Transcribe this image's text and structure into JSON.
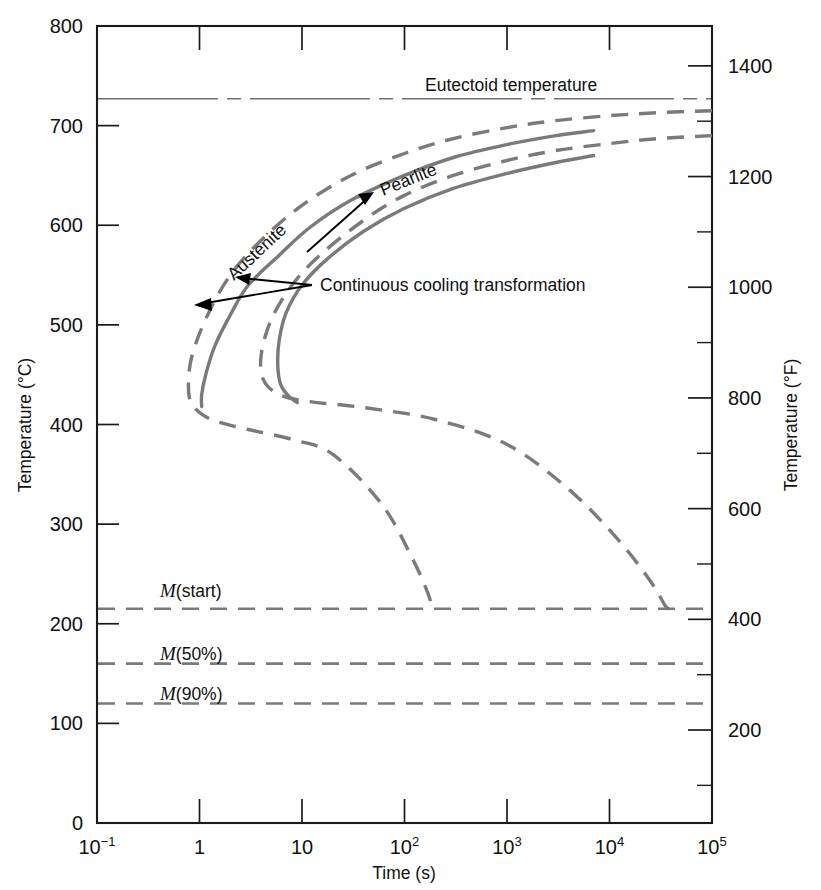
{
  "figure": {
    "kind": "continuous-cooling-transformation-diagram",
    "background_color": "#ffffff",
    "curve_color": "#7a7a7a",
    "axis_color": "#1a1a1a",
    "annotation_color": "#000000"
  },
  "axes": {
    "y_left": {
      "title": "Temperature (°C)",
      "ticks": [
        "800",
        "700",
        "600",
        "500",
        "400",
        "300",
        "200",
        "100",
        "0"
      ],
      "tick_values": [
        800,
        700,
        600,
        500,
        400,
        300,
        200,
        100,
        0
      ],
      "min": 0,
      "max": 800
    },
    "y_right": {
      "title": "Temperature (°F)",
      "ticks": [
        "1400",
        "1200",
        "1000",
        "800",
        "600",
        "400",
        "200"
      ],
      "tick_values": [
        1400,
        1200,
        1000,
        800,
        600,
        400,
        200
      ],
      "minor_tick_values": [
        1500,
        1300,
        1100,
        900,
        700,
        500,
        300,
        100
      ],
      "min": 32,
      "max": 1472
    },
    "x": {
      "title": "Time (s)",
      "scale": "log10",
      "min_exponent": -1,
      "max_exponent": 5,
      "ticks": [
        {
          "base": "10",
          "exp": "−1",
          "value": 0.1
        },
        {
          "base": "1",
          "exp": "",
          "value": 1
        },
        {
          "base": "10",
          "exp": "",
          "value": 10
        },
        {
          "base": "10",
          "exp": "2",
          "value": 100
        },
        {
          "base": "10",
          "exp": "3",
          "value": 1000
        },
        {
          "base": "10",
          "exp": "4",
          "value": 10000
        },
        {
          "base": "10",
          "exp": "5",
          "value": 100000
        }
      ]
    }
  },
  "reference_lines": [
    {
      "name": "eutectoid",
      "label": "Eutectoid temperature",
      "temperature_c": 727,
      "style": "dash-dot"
    },
    {
      "name": "m-start",
      "label_prefix": "M",
      "label_suffix": "(start)",
      "temperature_c": 215,
      "style": "dashed"
    },
    {
      "name": "m-50",
      "label_prefix": "M",
      "label_suffix": "(50%)",
      "temperature_c": 160,
      "style": "dashed"
    },
    {
      "name": "m-90",
      "label_prefix": "M",
      "label_suffix": "(90%)",
      "temperature_c": 120,
      "style": "dashed"
    }
  ],
  "annotations": {
    "austenite": "Austenite",
    "pearlite": "Pearlite",
    "continuous_cooling": "Continuous cooling transformation",
    "eutectoid": "Eutectoid temperature",
    "m_start_prefix": "M",
    "m_start_suffix": "(start)",
    "m_50_prefix": "M",
    "m_50_suffix": "(50%)",
    "m_90_prefix": "M",
    "m_90_suffix": "(90%)"
  },
  "chart_data": {
    "type": "line",
    "title": "",
    "xlabel": "Time (s)",
    "ylabel": "Temperature (°C)",
    "y2label": "Temperature (°F)",
    "xscale": "log",
    "xlim": [
      0.1,
      100000
    ],
    "ylim": [
      0,
      800
    ],
    "y2lim": [
      32,
      1472
    ],
    "grid": false,
    "legend": "none",
    "series": [
      {
        "name": "Isothermal transformation begins (TTT start)",
        "style": "dashed",
        "color": "#7a7a7a",
        "points": [
          [
            100000,
            715
          ],
          [
            30000,
            713
          ],
          [
            10000,
            710
          ],
          [
            3000,
            705
          ],
          [
            1000,
            698
          ],
          [
            300,
            687
          ],
          [
            100,
            672
          ],
          [
            30,
            650
          ],
          [
            10,
            620
          ],
          [
            4,
            585
          ],
          [
            2,
            550
          ],
          [
            1.2,
            510
          ],
          [
            0.85,
            470
          ],
          [
            0.78,
            440
          ],
          [
            0.85,
            420
          ],
          [
            1.3,
            405
          ],
          [
            3,
            395
          ],
          [
            8,
            385
          ],
          [
            20,
            370
          ],
          [
            60,
            320
          ],
          [
            120,
            265
          ],
          [
            170,
            230
          ],
          [
            185,
            215
          ]
        ]
      },
      {
        "name": "Isothermal transformation ends (TTT finish)",
        "style": "dashed",
        "color": "#7a7a7a",
        "points": [
          [
            100000,
            690
          ],
          [
            30000,
            687
          ],
          [
            10000,
            682
          ],
          [
            3000,
            675
          ],
          [
            1000,
            665
          ],
          [
            300,
            650
          ],
          [
            100,
            630
          ],
          [
            40,
            605
          ],
          [
            15,
            570
          ],
          [
            8,
            540
          ],
          [
            5,
            505
          ],
          [
            4,
            470
          ],
          [
            4.2,
            445
          ],
          [
            6,
            430
          ],
          [
            12,
            423
          ],
          [
            40,
            417
          ],
          [
            200,
            405
          ],
          [
            1000,
            380
          ],
          [
            4000,
            335
          ],
          [
            12000,
            285
          ],
          [
            25000,
            243
          ],
          [
            35000,
            218
          ],
          [
            38000,
            215
          ]
        ]
      },
      {
        "name": "Continuous cooling transformation begins (CCT start)",
        "style": "solid",
        "color": "#7a7a7a",
        "points": [
          [
            7000,
            695
          ],
          [
            3000,
            690
          ],
          [
            1000,
            681
          ],
          [
            300,
            668
          ],
          [
            100,
            650
          ],
          [
            30,
            625
          ],
          [
            12,
            598
          ],
          [
            6,
            570
          ],
          [
            3,
            540
          ],
          [
            2,
            510
          ],
          [
            1.4,
            478
          ],
          [
            1.15,
            450
          ],
          [
            1.05,
            430
          ],
          [
            1.05,
            418
          ]
        ]
      },
      {
        "name": "Continuous cooling transformation ends (CCT finish)",
        "style": "solid",
        "color": "#7a7a7a",
        "points": [
          [
            7000,
            670
          ],
          [
            3000,
            663
          ],
          [
            1000,
            652
          ],
          [
            300,
            637
          ],
          [
            100,
            617
          ],
          [
            40,
            594
          ],
          [
            18,
            567
          ],
          [
            10,
            540
          ],
          [
            7,
            512
          ],
          [
            6,
            485
          ],
          [
            5.8,
            460
          ],
          [
            6.2,
            440
          ],
          [
            7.5,
            428
          ],
          [
            9,
            422
          ]
        ]
      }
    ],
    "horizontal_lines": [
      {
        "label": "Eutectoid temperature",
        "y": 727
      },
      {
        "label": "M(start)",
        "y": 215
      },
      {
        "label": "M(50%)",
        "y": 160
      },
      {
        "label": "M(90%)",
        "y": 120
      }
    ]
  }
}
